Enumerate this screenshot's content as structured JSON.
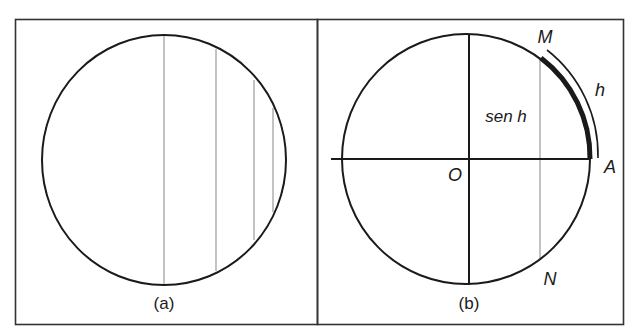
{
  "panels": [
    {
      "id": "a",
      "caption": "(a)"
    },
    {
      "id": "b",
      "caption": "(b)",
      "labels": {
        "point_m": "M",
        "point_a": "A",
        "point_n": "N",
        "origin": "O",
        "arc": "h",
        "sine": "sen h"
      }
    }
  ],
  "colors": {
    "stroke": "#1a1a1a",
    "chord": "#9a9a9a",
    "frame": "#333333"
  }
}
